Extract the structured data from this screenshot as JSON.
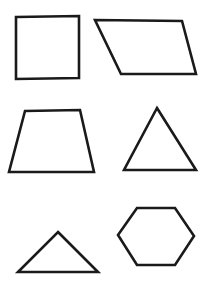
{
  "page": {
    "background_color": "#ffffff",
    "width": 206,
    "height": 297
  },
  "style": {
    "stroke_color": "#1a1a1a",
    "fill_color": "#ffffff",
    "stroke_width": 2.6
  },
  "shapes": [
    {
      "id": "square",
      "label": "Square",
      "sides": 4,
      "row": 1,
      "column": 1,
      "points": "16,17 79,16 79,78 16,79"
    },
    {
      "id": "parallelogram",
      "label": "Parallelogram",
      "sides": 4,
      "row": 1,
      "column": 2,
      "points": "95,20 182,21 196,74 121,74"
    },
    {
      "id": "trapezoid",
      "label": "Trapezoid",
      "sides": 4,
      "row": 2,
      "column": 1,
      "points": "25,111 80,110 94,172 9,172"
    },
    {
      "id": "acute-triangle",
      "label": "Acute triangle",
      "sides": 3,
      "row": 2,
      "column": 2,
      "points": "157,108 196,170 124,170"
    },
    {
      "id": "obtuse-triangle",
      "label": "Obtuse triangle",
      "sides": 3,
      "row": 3,
      "column": 1,
      "points": "58,232 98,272 18,272"
    },
    {
      "id": "hexagon",
      "label": "Hexagon",
      "sides": 6,
      "row": 3,
      "column": 2,
      "points": "137,208 175,208 194,236 175,265 137,265 118,235"
    }
  ]
}
